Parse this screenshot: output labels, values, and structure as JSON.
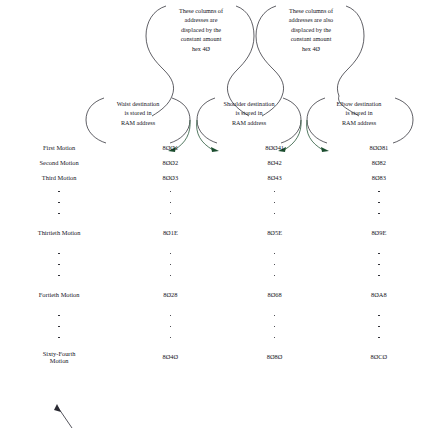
{
  "diagram": {
    "ink_color": "#15151e",
    "arrow_color": "#1b4d2e"
  },
  "callouts": {
    "top": [
      {
        "id": "waist-offset-note",
        "lines": [
          "These columns of",
          "addresses are",
          "displaced by the",
          "constant amount",
          "hex 4Ø"
        ]
      },
      {
        "id": "shoulder-offset-note",
        "lines": [
          "These columns of",
          "addresses are also",
          "displaced by the",
          "constant amount",
          "hex 4Ø"
        ]
      }
    ],
    "columns": [
      {
        "id": "waist-note",
        "lines": [
          "Waist destination",
          "is stored in",
          "RAM address"
        ]
      },
      {
        "id": "shoulder-note",
        "lines": [
          "Shoulder destination",
          "is stored in",
          "RAM address"
        ]
      },
      {
        "id": "elbow-note",
        "lines": [
          "Elbow destination",
          "is stored in",
          "RAM address"
        ]
      }
    ]
  },
  "table": {
    "rows": [
      {
        "type": "data",
        "label": "First Motion",
        "label_lines": [
          "First Motion"
        ],
        "values": [
          "8ØØ1",
          "8ØØ41",
          "8ØØ81"
        ]
      },
      {
        "type": "data",
        "label": "Second Motion",
        "label_lines": [
          "Second Motion"
        ],
        "values": [
          "8ØØ2",
          "8Ø42",
          "8Ø82"
        ]
      },
      {
        "type": "data",
        "label": "Third Motion",
        "label_lines": [
          "Third Motion"
        ],
        "values": [
          "8ØØ3",
          "8Ø43",
          "8Ø83"
        ]
      },
      {
        "type": "dots"
      },
      {
        "type": "dots"
      },
      {
        "type": "dots"
      },
      {
        "type": "gap"
      },
      {
        "type": "data",
        "label": "Thirtieth Motion",
        "label_lines": [
          "Thirtieth Motion"
        ],
        "values": [
          "8Ø1E",
          "8Ø5E",
          "8Ø9E"
        ]
      },
      {
        "type": "gap"
      },
      {
        "type": "dots"
      },
      {
        "type": "dots"
      },
      {
        "type": "dots"
      },
      {
        "type": "gap"
      },
      {
        "type": "data",
        "label": "Fortieth Motion",
        "label_lines": [
          "Fortieth Motion"
        ],
        "values": [
          "8Ø28",
          "8Ø68",
          "8ØA8"
        ]
      },
      {
        "type": "gap"
      },
      {
        "type": "dots"
      },
      {
        "type": "dots"
      },
      {
        "type": "dots"
      },
      {
        "type": "gap"
      },
      {
        "type": "data",
        "label": "Sixty-Fourth Motion",
        "label_lines": [
          "Sixty-Fourth",
          "Motion"
        ],
        "values": [
          "8Ø4Ø",
          "8Ø8Ø",
          "8ØCØ"
        ]
      }
    ]
  }
}
